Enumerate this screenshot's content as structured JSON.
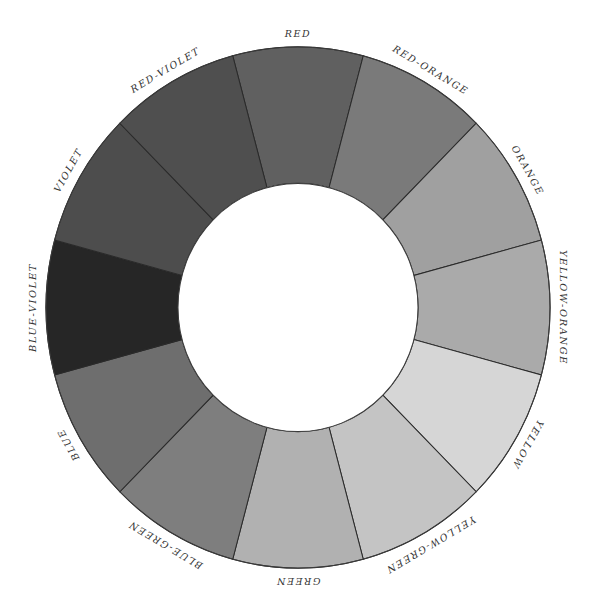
{
  "diagram": {
    "type": "color-wheel",
    "segment_count": 12,
    "segments": [
      {
        "label": "RED",
        "angle": 0,
        "fill": "#606060"
      },
      {
        "label": "RED-ORANGE",
        "angle": 30,
        "fill": "#7a7a7a"
      },
      {
        "label": "ORANGE",
        "angle": 60,
        "fill": "#a0a0a0"
      },
      {
        "label": "YELLOW-ORANGE",
        "angle": 90,
        "fill": "#aaaaaa"
      },
      {
        "label": "YELLOW",
        "angle": 120,
        "fill": "#d6d6d6"
      },
      {
        "label": "YELLOW-GREEN",
        "angle": 150,
        "fill": "#c4c4c4"
      },
      {
        "label": "GREEN",
        "angle": 180,
        "fill": "#b1b1b1"
      },
      {
        "label": "BLUE-GREEN",
        "angle": 210,
        "fill": "#7e7e7e"
      },
      {
        "label": "BLUE",
        "angle": 240,
        "fill": "#6e6e6e"
      },
      {
        "label": "BLUE-VIOLET",
        "angle": 270,
        "fill": "#262626"
      },
      {
        "label": "VIOLET",
        "angle": 300,
        "fill": "#4d4d4d"
      },
      {
        "label": "RED-VIOLET",
        "angle": 330,
        "fill": "#4f4f4f"
      }
    ]
  }
}
